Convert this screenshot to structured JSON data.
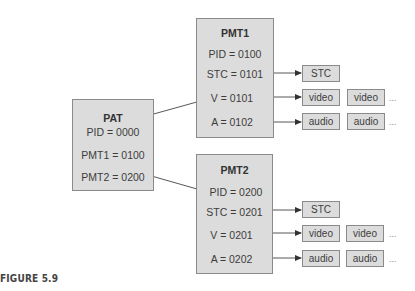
{
  "pat": {
    "title": "PAT",
    "rows": [
      "PID = 0000",
      "PMT1 = 0100",
      "PMT2 = 0200"
    ]
  },
  "pmt1": {
    "title": "PMT1",
    "rows": [
      "PID = 0100",
      "STC = 0101",
      "V = 0101",
      "A = 0102"
    ],
    "outputs": {
      "stc": "STC",
      "video": [
        "video",
        "video"
      ],
      "audio": [
        "audio",
        "audio"
      ],
      "ellipsis": "..."
    }
  },
  "pmt2": {
    "title": "PMT2",
    "rows": [
      "PID = 0200",
      "STC = 0201",
      "V = 0201",
      "A = 0202"
    ],
    "outputs": {
      "stc": "STC",
      "video": [
        "video",
        "video"
      ],
      "audio": [
        "audio",
        "audio"
      ],
      "ellipsis": "..."
    }
  },
  "caption": "FIGURE 5.9",
  "colors": {
    "box_fill": "#dcdcdc",
    "box_border": "#8a8a8a",
    "line": "#333333"
  }
}
